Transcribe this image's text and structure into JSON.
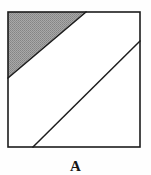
{
  "figure": {
    "label": "A",
    "background_color": "#fefefe",
    "shape": {
      "name": "square",
      "fill_color": "#ffffff",
      "stroke_color": "#1c1c1c",
      "stroke_width": 1.6,
      "left": 8,
      "top": 12,
      "right": 140,
      "bottom": 147,
      "width": 132,
      "height": 135
    },
    "shaded_region": {
      "name": "top-left-triangle",
      "fill_color": "#9a9a9a",
      "pattern": "halftone-dither",
      "vertices": "8,12 86,12 8,78",
      "fraction_of_square": "approximately one eighth"
    },
    "lines": [
      {
        "name": "upper-diagonal",
        "x1": 86,
        "y1": 12,
        "x2": 8,
        "y2": 78,
        "stroke_color": "#1c1c1c",
        "stroke_width": 1.5
      },
      {
        "name": "lower-diagonal",
        "x1": 140,
        "y1": 41,
        "x2": 33,
        "y2": 147,
        "stroke_color": "#1c1c1c",
        "stroke_width": 1.5
      }
    ]
  }
}
